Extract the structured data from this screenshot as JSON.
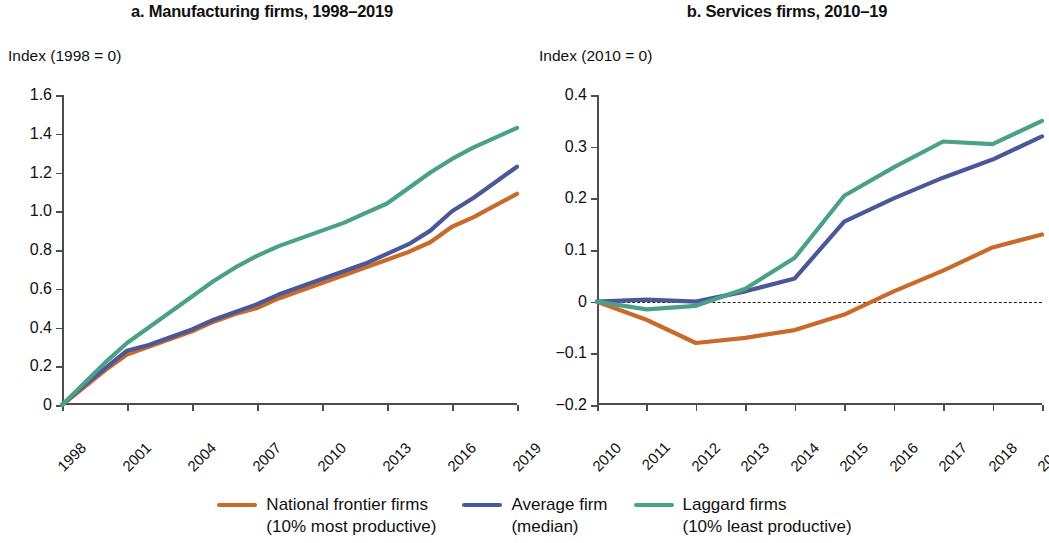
{
  "panels": [
    {
      "id": "manufacturing",
      "title": "a. Manufacturing firms, 1998–2019",
      "axis_caption": "Index (1998 = 0)"
    },
    {
      "id": "services",
      "title": "b. Services firms, 2010–19",
      "axis_caption": "Index (2010 = 0)"
    }
  ],
  "legend": {
    "items": [
      {
        "label": "National frontier firms",
        "sublabel": "(10% most productive)",
        "color": "#c96a2b",
        "swatch_name": "legend-swatch-frontier"
      },
      {
        "label": "Average firm",
        "sublabel": "(median)",
        "color": "#4a5899",
        "swatch_name": "legend-swatch-average"
      },
      {
        "label": "Laggard firms",
        "sublabel": "(10% least productive)",
        "color": "#4ba088",
        "swatch_name": "legend-swatch-laggard"
      }
    ]
  },
  "chart_data": [
    {
      "type": "line",
      "panel": "a",
      "title": "a. Manufacturing firms, 1998–2019",
      "ylabel": "Index (1998 = 0)",
      "xlabel": "",
      "ylim": [
        0,
        1.6
      ],
      "yticks": [
        0,
        0.2,
        0.4,
        0.6,
        0.8,
        1.0,
        1.2,
        1.4,
        1.6
      ],
      "ytick_labels": [
        "0",
        "0.2",
        "0.4",
        "0.6",
        "0.8",
        "1.0",
        "1.2",
        "1.4",
        "1.6"
      ],
      "x": [
        1998,
        1999,
        2000,
        2001,
        2002,
        2003,
        2004,
        2005,
        2006,
        2007,
        2008,
        2009,
        2010,
        2011,
        2012,
        2013,
        2014,
        2015,
        2016,
        2017,
        2018,
        2019
      ],
      "xticks": [
        1998,
        2001,
        2004,
        2007,
        2010,
        2013,
        2016,
        2019
      ],
      "xtick_labels": [
        "1998",
        "2001",
        "2004",
        "2007",
        "2010",
        "2013",
        "2016",
        "2019"
      ],
      "grid": false,
      "zero_line": false,
      "series": [
        {
          "name": "National frontier firms (10% most productive)",
          "color": "#c96a2b",
          "values": [
            0,
            0.09,
            0.18,
            0.26,
            0.3,
            0.34,
            0.38,
            0.43,
            0.47,
            0.5,
            0.55,
            0.59,
            0.63,
            0.67,
            0.71,
            0.75,
            0.79,
            0.84,
            0.92,
            0.97,
            1.03,
            1.09
          ]
        },
        {
          "name": "Average firm (median)",
          "color": "#4a5899",
          "values": [
            0,
            0.1,
            0.19,
            0.28,
            0.31,
            0.35,
            0.39,
            0.44,
            0.48,
            0.52,
            0.57,
            0.61,
            0.65,
            0.69,
            0.73,
            0.78,
            0.83,
            0.9,
            1.0,
            1.07,
            1.15,
            1.23
          ]
        },
        {
          "name": "Laggard firms (10% least productive)",
          "color": "#4ba088",
          "values": [
            0,
            0.11,
            0.22,
            0.32,
            0.4,
            0.48,
            0.56,
            0.64,
            0.71,
            0.77,
            0.82,
            0.86,
            0.9,
            0.94,
            0.99,
            1.04,
            1.12,
            1.2,
            1.27,
            1.33,
            1.38,
            1.43
          ]
        }
      ]
    },
    {
      "type": "line",
      "panel": "b",
      "title": "b. Services firms, 2010–19",
      "ylabel": "Index (2010 = 0)",
      "xlabel": "",
      "ylim": [
        -0.2,
        0.4
      ],
      "yticks": [
        -0.2,
        -0.1,
        0,
        0.1,
        0.2,
        0.3,
        0.4
      ],
      "ytick_labels": [
        "−0.2",
        "−0.1",
        "0",
        "0.1",
        "0.2",
        "0.3",
        "0.4"
      ],
      "x": [
        2010,
        2011,
        2012,
        2013,
        2014,
        2015,
        2016,
        2017,
        2018,
        2019
      ],
      "xticks": [
        2010,
        2011,
        2012,
        2013,
        2014,
        2015,
        2016,
        2017,
        2018,
        2019
      ],
      "xtick_labels": [
        "2010",
        "2011",
        "2012",
        "2013",
        "2014",
        "2015",
        "2016",
        "2017",
        "2018",
        "2019"
      ],
      "grid": false,
      "zero_line": true,
      "series": [
        {
          "name": "National frontier firms (10% most productive)",
          "color": "#c96a2b",
          "values": [
            0,
            -0.035,
            -0.08,
            -0.07,
            -0.055,
            -0.025,
            0.02,
            0.06,
            0.105,
            0.13
          ]
        },
        {
          "name": "Average firm (median)",
          "color": "#4a5899",
          "values": [
            0,
            0.004,
            0,
            0.02,
            0.045,
            0.155,
            0.2,
            0.24,
            0.275,
            0.32
          ]
        },
        {
          "name": "Laggard firms (10% least productive)",
          "color": "#4ba088",
          "values": [
            0,
            -0.015,
            -0.008,
            0.025,
            0.085,
            0.205,
            0.26,
            0.31,
            0.305,
            0.35
          ]
        }
      ]
    }
  ]
}
